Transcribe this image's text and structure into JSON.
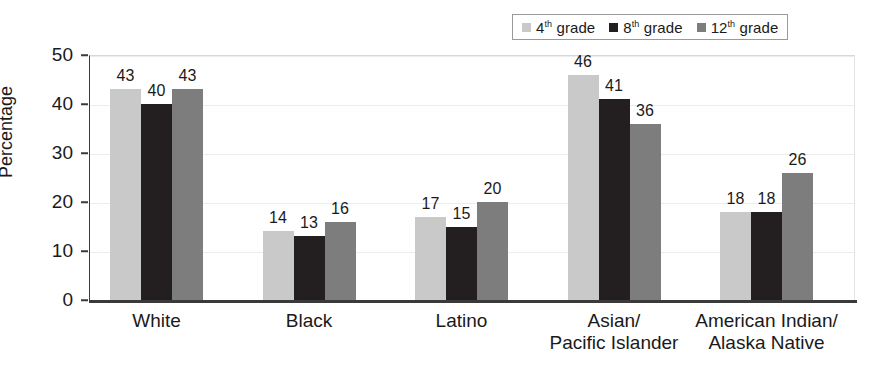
{
  "chart_data": {
    "type": "bar",
    "title": "",
    "xlabel": "",
    "ylabel": "Percentage",
    "ylim": [
      0,
      50
    ],
    "yticks": [
      0,
      10,
      20,
      30,
      40,
      50
    ],
    "grid": true,
    "legend_position": "top-right",
    "categories": [
      "White",
      "Black",
      "Latino",
      "Asian/\nPacific Islander",
      "American Indian/\nAlaska Native"
    ],
    "category_lines": [
      [
        "White"
      ],
      [
        "Black"
      ],
      [
        "Latino"
      ],
      [
        "Asian/",
        "Pacific Islander"
      ],
      [
        "American Indian/",
        "Alaska Native"
      ]
    ],
    "series": [
      {
        "name": "4th grade",
        "name_number": "4",
        "name_ordinal": "th",
        "name_suffix": " grade",
        "color": "#c9c9c9",
        "values": [
          43,
          40,
          43,
          46,
          18
        ]
      },
      {
        "name": "8th grade",
        "name_number": "8",
        "name_ordinal": "th",
        "name_suffix": " grade",
        "color": "#231f20",
        "values": [
          40,
          13,
          15,
          41,
          18
        ]
      },
      {
        "name": "12th grade",
        "name_number": "12",
        "name_ordinal": "th",
        "name_suffix": " grade",
        "color": "#7d7d7d",
        "values": [
          43,
          16,
          20,
          36,
          26
        ]
      }
    ],
    "values_by_group": [
      {
        "category": "White",
        "values": [
          43,
          40,
          43
        ]
      },
      {
        "category": "Black",
        "values": [
          14,
          13,
          16
        ]
      },
      {
        "category": "Latino",
        "values": [
          17,
          15,
          20
        ]
      },
      {
        "category": "Asian/Pacific Islander",
        "values": [
          46,
          41,
          36
        ]
      },
      {
        "category": "American Indian/Alaska Native",
        "values": [
          18,
          18,
          26
        ]
      }
    ],
    "axis_color": "#3a3a3a",
    "gridline_color": "#ececec",
    "background": "#ffffff"
  }
}
